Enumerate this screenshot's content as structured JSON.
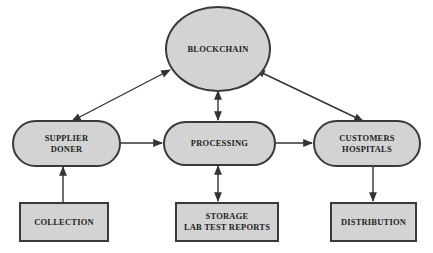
{
  "diagram": {
    "colors": {
      "node_fill": "#d3d3d3",
      "node_stroke": "#3a3a3a",
      "text": "#1e1e1e",
      "arrow": "#333333",
      "background": "#ffffff"
    },
    "nodes": {
      "blockchain": {
        "label": "BLOCKCHAIN",
        "shape": "ellipse"
      },
      "supplier": {
        "label": "SUPPLIER\nDONER",
        "shape": "pill"
      },
      "processing": {
        "label": "PROCESSING",
        "shape": "pill"
      },
      "customers": {
        "label": "CUSTOMERS\nHOSPITALS",
        "shape": "pill"
      },
      "collection": {
        "label": "COLLECTION",
        "shape": "rectangle"
      },
      "storage": {
        "label": "STORAGE\nLAB TEST REPORTS",
        "shape": "rectangle"
      },
      "distribution": {
        "label": "DISTRIBUTION",
        "shape": "rectangle"
      }
    },
    "edges": [
      {
        "from": "blockchain",
        "to": "supplier",
        "direction": "both"
      },
      {
        "from": "blockchain",
        "to": "processing",
        "direction": "both"
      },
      {
        "from": "blockchain",
        "to": "customers",
        "direction": "both"
      },
      {
        "from": "supplier",
        "to": "processing",
        "direction": "forward"
      },
      {
        "from": "processing",
        "to": "customers",
        "direction": "forward"
      },
      {
        "from": "collection",
        "to": "supplier",
        "direction": "forward"
      },
      {
        "from": "processing",
        "to": "storage",
        "direction": "both"
      },
      {
        "from": "customers",
        "to": "distribution",
        "direction": "forward"
      }
    ]
  }
}
